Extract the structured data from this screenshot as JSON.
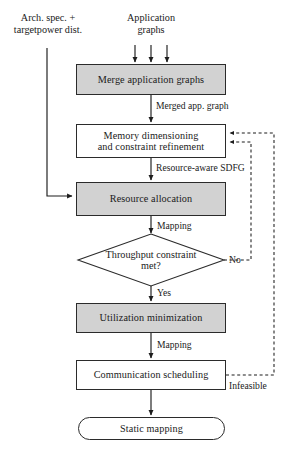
{
  "figure": {
    "colors": {
      "shaded_fill": "#d2d2d2",
      "plain_fill": "#ffffff",
      "stroke": "#2b2b2b",
      "background": "#ffffff"
    }
  },
  "inputs": {
    "arch_spec": "Arch. spec. +\ntargetpower dist.",
    "application_graphs": "Application\ngraphs"
  },
  "nodes": {
    "merge": {
      "label": "Merge application graphs",
      "shape": "rect",
      "style": "shaded"
    },
    "memory": {
      "label": "Memory dimensioning\nand constraint refinement",
      "shape": "rect",
      "style": "plain"
    },
    "resource": {
      "label": "Resource allocation",
      "shape": "rect",
      "style": "shaded"
    },
    "decision": {
      "label": "Throughput constraint\nmet?",
      "shape": "diamond",
      "style": "plain"
    },
    "utilization": {
      "label": "Utilization minimization",
      "shape": "rect",
      "style": "shaded"
    },
    "communication": {
      "label": "Communication scheduling",
      "shape": "rect",
      "style": "plain"
    },
    "static": {
      "label": "Static mapping",
      "shape": "terminal",
      "style": "plain"
    }
  },
  "edge_labels": {
    "merged_app_graph": "Merged app. graph",
    "resource_aware_sdfg": "Resource-aware SDFG",
    "mapping_after_resource": "Mapping",
    "yes": "Yes",
    "no": "No",
    "mapping_after_utilization": "Mapping",
    "infeasible": "Infeasible"
  }
}
